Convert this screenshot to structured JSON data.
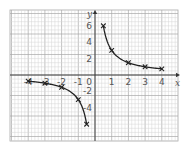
{
  "chart_data": {
    "type": "line",
    "title": "",
    "xlabel": "x",
    "ylabel": "y",
    "function": "y = 3/x",
    "xlim": [
      -4.9,
      5
    ],
    "ylim": [
      -8.4,
      8.2
    ],
    "x_ticks": [
      -4,
      -3,
      -2,
      -1,
      1,
      2,
      3,
      4
    ],
    "x_tick_labels": [
      "-4",
      "-3",
      "-2",
      "-1",
      "1",
      "2",
      "3",
      "4"
    ],
    "y_ticks": [
      6,
      4,
      2,
      -2,
      -4
    ],
    "y_tick_labels": [
      "6",
      "4",
      "2",
      "-2",
      "-4"
    ],
    "origin_label": "0",
    "grid": true,
    "series": [
      {
        "name": "branch-negative",
        "x": [
          -4,
          -3,
          -2,
          -1,
          -0.5
        ],
        "y": [
          -0.75,
          -1,
          -1.5,
          -3,
          -6
        ],
        "marker": "x"
      },
      {
        "name": "branch-positive",
        "x": [
          0.5,
          1,
          2,
          3,
          4
        ],
        "y": [
          6,
          3,
          1.5,
          1,
          0.75
        ],
        "marker": "x"
      }
    ]
  },
  "colors": {
    "grid_minor": "#d4d4d4",
    "grid_major": "#a8a8a8",
    "axis": "#333333",
    "curve": "#222222",
    "text": "#555555"
  }
}
